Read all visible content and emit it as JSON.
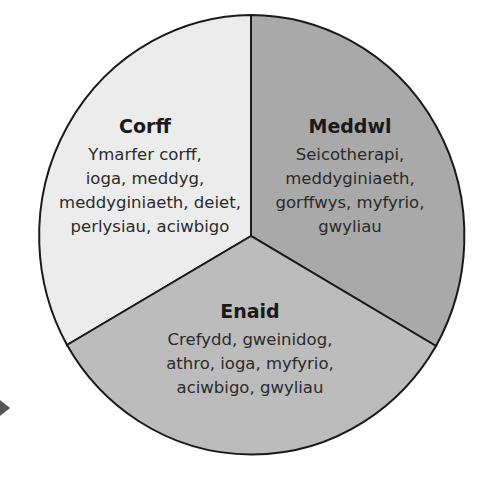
{
  "diagram": {
    "type": "pie-three-segments",
    "colors": {
      "corff": "#ececec",
      "meddwl": "#a9a9a9",
      "enaid": "#bcbcbc",
      "outline": "#1a1a1a"
    },
    "segments": [
      {
        "id": "corff",
        "title": "Corff",
        "lines": [
          "Ymarfer corff,",
          "ioga, meddyg,",
          "meddyginiaeth, deiet,",
          "perlysiau, aciwbigo"
        ]
      },
      {
        "id": "meddwl",
        "title": "Meddwl",
        "lines": [
          "Seicotherapi,",
          "meddyginiaeth,",
          "gorffwys, myfyrio,",
          "gwyliau"
        ]
      },
      {
        "id": "enaid",
        "title": "Enaid",
        "lines": [
          "Crefydd, gweinidog,",
          "athro, ioga, myfyrio,",
          "aciwbigo, gwyliau"
        ]
      }
    ]
  }
}
